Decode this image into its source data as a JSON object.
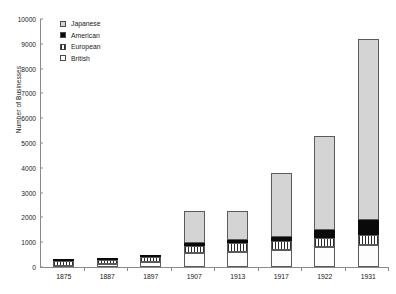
{
  "chart_data": {
    "type": "bar",
    "stacked": true,
    "title": "",
    "xlabel": "",
    "ylabel": "Number of Businesses",
    "ylim": [
      0,
      10000
    ],
    "ytick_step": 1000,
    "yticks": [
      "0",
      "1000",
      "2000",
      "3000",
      "4000",
      "5000",
      "6000",
      "7000",
      "8000",
      "9000",
      "10000"
    ],
    "grid": false,
    "legend_position": "top-left",
    "categories": [
      "1875",
      "1887",
      "1897",
      "1907",
      "1913",
      "1917",
      "1922",
      "1931"
    ],
    "series": [
      {
        "name": "British",
        "swatch": "dotted",
        "color": "#fdfdfd",
        "values": [
          60,
          110,
          190,
          560,
          620,
          700,
          800,
          900
        ]
      },
      {
        "name": "European",
        "swatch": "vertical-stripes",
        "color": "#ffffff",
        "values": [
          190,
          170,
          230,
          300,
          330,
          360,
          380,
          400
        ]
      },
      {
        "name": "American",
        "swatch": "solid-black",
        "color": "#0a0a0a",
        "values": [
          10,
          15,
          30,
          110,
          120,
          140,
          300,
          600
        ]
      },
      {
        "name": "Japanese",
        "swatch": "light-gray",
        "color": "#d4d4d4",
        "values": [
          0,
          0,
          0,
          1280,
          1180,
          2600,
          3820,
          7300
        ]
      }
    ],
    "totals": [
      260,
      295,
      450,
      2250,
      2250,
      3800,
      5300,
      9200
    ],
    "legend_entries": [
      "Japanese",
      "American",
      "European",
      "British"
    ]
  },
  "caption": ""
}
